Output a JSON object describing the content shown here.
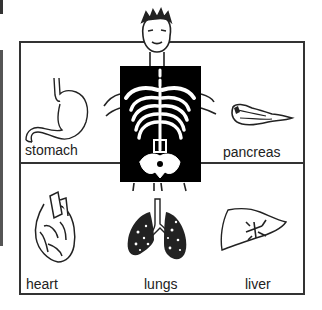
{
  "figure": {
    "central_figure": "boy holding x-ray of skeleton",
    "organs": [
      {
        "label": "stomach",
        "icon": "stomach-icon"
      },
      {
        "label": "pancreas",
        "icon": "pancreas-icon"
      },
      {
        "label": "heart",
        "icon": "heart-icon"
      },
      {
        "label": "lungs",
        "icon": "lungs-icon"
      },
      {
        "label": "liver",
        "icon": "liver-icon"
      }
    ]
  },
  "colors": {
    "ink": "#222222",
    "xray_background": "#000000",
    "paper": "#ffffff"
  }
}
